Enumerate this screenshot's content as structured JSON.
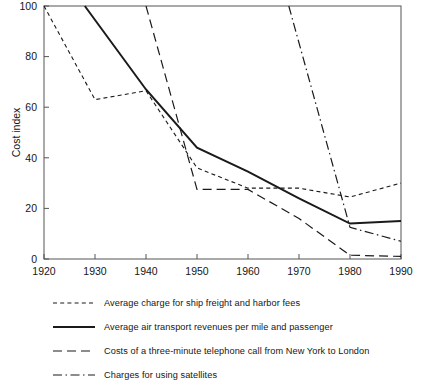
{
  "chart_data": {
    "type": "line",
    "title": "",
    "xlabel": "",
    "ylabel": "Cost index",
    "xlim": [
      1920,
      1990
    ],
    "ylim": [
      0,
      100
    ],
    "xticks": [
      1920,
      1930,
      1940,
      1950,
      1960,
      1970,
      1980,
      1990
    ],
    "yticks": [
      0,
      20,
      40,
      60,
      80,
      100
    ],
    "grid": false,
    "legend_position": "below",
    "x": [
      1920,
      1930,
      1940,
      1950,
      1960,
      1970,
      1980,
      1990
    ],
    "series": [
      {
        "name": "Average charge for ship freight and harbor fees",
        "style": "dotted",
        "x": [
          1920,
          1930,
          1940,
          1950,
          1960,
          1970,
          1980,
          1990
        ],
        "values": [
          100,
          63,
          66.5,
          36,
          28,
          28,
          24.5,
          30
        ]
      },
      {
        "name": "Average air transport revenues per mile and passenger",
        "style": "solid",
        "x": [
          1928,
          1940,
          1950,
          1960,
          1970,
          1980,
          1990
        ],
        "values": [
          100,
          67,
          44,
          34.5,
          24,
          14,
          15
        ]
      },
      {
        "name": "Costs of a three-minute telephone call from New York to London",
        "style": "dashed",
        "x": [
          1940,
          1950,
          1960,
          1970,
          1980,
          1990
        ],
        "values": [
          100,
          27.5,
          27.5,
          16,
          1.5,
          1
        ]
      },
      {
        "name": "Charges for using satellites",
        "style": "dash-dot",
        "x": [
          1968,
          1980,
          1990
        ],
        "values": [
          100,
          12.5,
          7
        ]
      }
    ]
  },
  "legend": {
    "items": [
      {
        "label": "Average charge for ship freight and harbor fees",
        "style": "dotted"
      },
      {
        "label": "Average air transport revenues per mile and passenger",
        "style": "solid"
      },
      {
        "label": "Costs of a three-minute telephone call from New York to London",
        "style": "dashed"
      },
      {
        "label": "Charges for using satellites",
        "style": "dash-dot"
      }
    ]
  },
  "axes": {
    "y_title": "Cost index",
    "y_tick_labels": [
      "0",
      "20",
      "40",
      "60",
      "80",
      "100"
    ],
    "x_tick_labels": [
      "1920",
      "1930",
      "1940",
      "1950",
      "1960",
      "1970",
      "1980",
      "1990"
    ]
  },
  "colors": {
    "line": "#1a1a1a",
    "axis": "#4a4a4a",
    "background": "#ffffff"
  }
}
